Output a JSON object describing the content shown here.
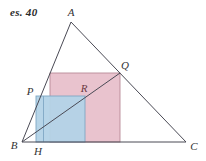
{
  "figure": {
    "exercise_label": "es. 40",
    "background_color": "#ffffff",
    "width": 206,
    "height": 161
  },
  "colors": {
    "pink_fill": "#e9c3ce",
    "pink_stroke": "#b98b98",
    "blue_fill": "#b3d3e7",
    "blue_stroke": "#7fa7c4",
    "line_stroke": "#4a4a55",
    "label_color": "#333333",
    "label_accent": "#6b3a44"
  },
  "points": [
    {
      "id": "A",
      "label": "A",
      "x": 71,
      "y": 22,
      "label_x": 71,
      "label_y": 12
    },
    {
      "id": "B",
      "label": "B",
      "x": 22,
      "y": 142,
      "label_x": 14,
      "label_y": 145
    },
    {
      "id": "C",
      "label": "C",
      "x": 186,
      "y": 142,
      "label_x": 194,
      "label_y": 146
    },
    {
      "id": "Q",
      "label": "Q",
      "x": 120,
      "y": 73,
      "label_x": 125,
      "label_y": 65
    },
    {
      "id": "P",
      "label": "P",
      "x": 36,
      "y": 96,
      "label_x": 30,
      "label_y": 91
    },
    {
      "id": "R",
      "label": "R",
      "x": 85,
      "y": 96,
      "label_x": 84,
      "label_y": 88
    },
    {
      "id": "H",
      "label": "H",
      "x": 36,
      "y": 142,
      "label_x": 38,
      "label_y": 151
    }
  ],
  "segments": [
    {
      "name": "side-AB",
      "x1": 71,
      "y1": 22,
      "x2": 22,
      "y2": 142
    },
    {
      "name": "side-AC",
      "x1": 71,
      "y1": 22,
      "x2": 186,
      "y2": 142
    },
    {
      "name": "side-BC",
      "x1": 22,
      "y1": 142,
      "x2": 186,
      "y2": 142
    },
    {
      "name": "diagonal-BQ",
      "x1": 22,
      "y1": 142,
      "x2": 120,
      "y2": 73
    }
  ],
  "shapes": {
    "pink_square": {
      "name": "pink-square-PQ",
      "x": 50,
      "y": 73,
      "width": 70,
      "height": 69,
      "fill": "#e9c3ce",
      "stroke": "#b98b98"
    },
    "blue_square": {
      "name": "blue-square-PHR",
      "x": 36,
      "y": 96,
      "width": 49,
      "height": 46,
      "fill": "#b3d3e7",
      "stroke": "#7fa7c4"
    }
  }
}
